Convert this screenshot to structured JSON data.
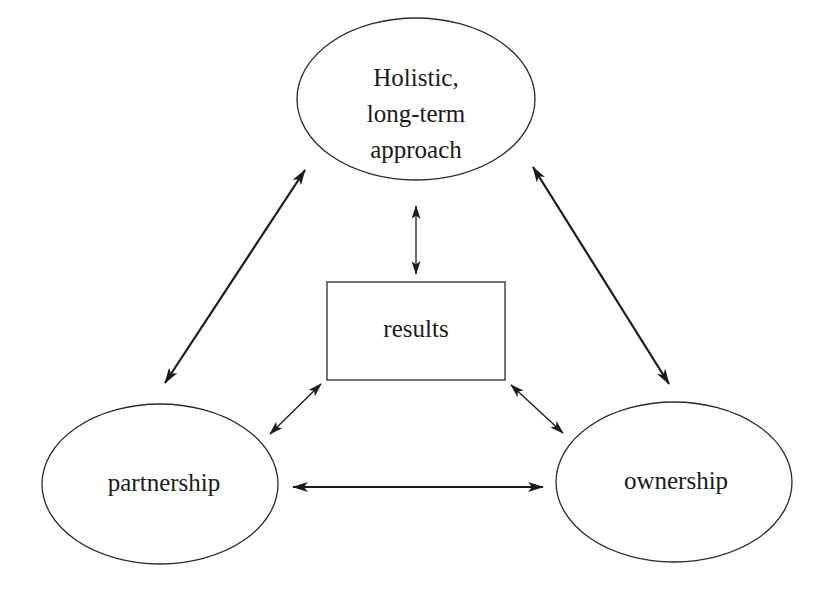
{
  "diagram": {
    "type": "concept-triangle",
    "nodes": {
      "top": {
        "shape": "ellipse",
        "lines": [
          "Holistic,",
          "long-term",
          "approach"
        ]
      },
      "center": {
        "shape": "rectangle",
        "label": "results"
      },
      "left": {
        "shape": "ellipse",
        "label": "partnership"
      },
      "right": {
        "shape": "ellipse",
        "label": "ownership"
      }
    },
    "edges": [
      {
        "from": "top",
        "to": "left",
        "direction": "bidirectional"
      },
      {
        "from": "top",
        "to": "right",
        "direction": "bidirectional"
      },
      {
        "from": "top",
        "to": "center",
        "direction": "bidirectional"
      },
      {
        "from": "center",
        "to": "left",
        "direction": "bidirectional"
      },
      {
        "from": "center",
        "to": "right",
        "direction": "bidirectional"
      },
      {
        "from": "left",
        "to": "right",
        "direction": "bidirectional"
      }
    ],
    "colors": {
      "stroke": "#2a2a2a",
      "arrow": "#1a1a1a",
      "background": "#ffffff"
    }
  }
}
